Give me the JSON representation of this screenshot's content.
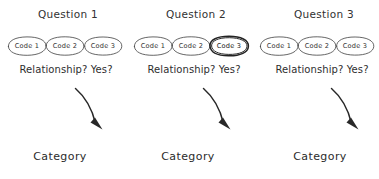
{
  "diagram": {
    "style": "hand-drawn sketch",
    "stroke_color": "#2b2b2b",
    "background_color": "#ffffff",
    "emphasis_color": "#171717",
    "columns": [
      {
        "title": "Question 1",
        "codes": [
          {
            "label": "Code 1",
            "emphasized": false
          },
          {
            "label": "Code 2",
            "emphasized": false
          },
          {
            "label": "Code 3",
            "emphasized": false
          }
        ],
        "relationship": "Relationship? Yes?",
        "arrow": "curved-arrow-down-right",
        "outcome": "Category"
      },
      {
        "title": "Question 2",
        "codes": [
          {
            "label": "Code 1",
            "emphasized": false
          },
          {
            "label": "Code 2",
            "emphasized": false
          },
          {
            "label": "Code 3",
            "emphasized": true
          }
        ],
        "relationship": "Relationship? Yes?",
        "arrow": "curved-arrow-down-right",
        "outcome": "Category"
      },
      {
        "title": "Question 3",
        "codes": [
          {
            "label": "Code 1",
            "emphasized": false
          },
          {
            "label": "Code 2",
            "emphasized": false
          },
          {
            "label": "Code 3",
            "emphasized": false
          }
        ],
        "relationship": "Relationship? Yes?",
        "arrow": "curved-arrow-down-right",
        "outcome": "Category"
      }
    ]
  }
}
